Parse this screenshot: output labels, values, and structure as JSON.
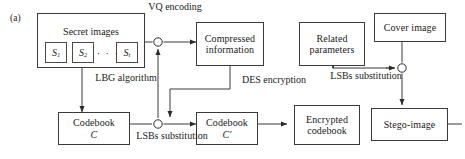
{
  "figure": {
    "panel_label": "(a)",
    "width": 465,
    "height": 159,
    "line_color": "#3a3a3a",
    "text_color": "#1a1a1a",
    "background": "#ffffff"
  },
  "group": {
    "title": "Secret images",
    "items": [
      {
        "label": "S",
        "subscript": "1"
      },
      {
        "label": "S",
        "subscript": "2"
      },
      {
        "label": "S",
        "subscript": "t"
      }
    ],
    "ellipsis": "· · ·"
  },
  "nodes": {
    "compressed_information": {
      "line1": "Compressed",
      "line2": "information"
    },
    "related_parameters": {
      "line1": "Related",
      "line2": "parameters"
    },
    "cover_image": {
      "line1": "Cover image",
      "line2": ""
    },
    "codebook_c": {
      "line1": "Codebook",
      "line2": "C"
    },
    "codebook_c_prime": {
      "line1": "Codebook",
      "line2": "C′"
    },
    "encrypted_codebook": {
      "line1": "Encrypted",
      "line2": "codebook"
    },
    "stego_image": {
      "line1": "Stego-image",
      "line2": ""
    }
  },
  "edge_labels": {
    "vq_encoding": {
      "line1": "VQ",
      "line2": "encoding"
    },
    "lbg_algorithm": {
      "line1": "LBG",
      "line2": "algorithm"
    },
    "lsbs_substitution_left": {
      "line1": "LSBs",
      "line2": "substitution"
    },
    "des_encryption": {
      "line1": "DES",
      "line2": "encryption"
    },
    "lsbs_substitution_right": {
      "line1": "LSBs",
      "line2": "substitution"
    }
  }
}
